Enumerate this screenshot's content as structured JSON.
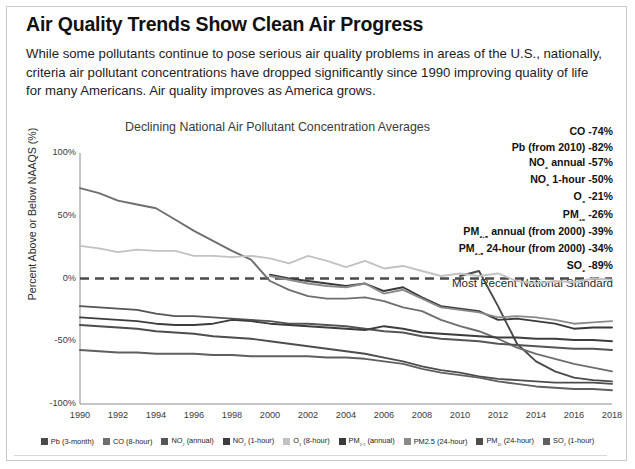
{
  "headline": "Air Quality Trends Show Clean Air Progress",
  "deck": "While some pollutants continue to pose serious air quality problems in areas of the U.S., nationally, criteria air pollutant concentrations have dropped significantly since 1990 improving quality of life for many Americans. Air quality improves as America grows.",
  "standard_note": "Most Recent National Standard",
  "annotations": [
    {
      "label": "CO",
      "value": "-74%"
    },
    {
      "label": "Pb (from 2010)",
      "value": "-82%"
    },
    {
      "label": "NO₂ annual",
      "value": "-57%"
    },
    {
      "label": "NO₂ 1-hour",
      "value": "-50%"
    },
    {
      "label": "O₃",
      "value": "-21%"
    },
    {
      "label": "PM₁₀",
      "value": "-26%"
    },
    {
      "label": "PM₂.₅ annual (from 2000)",
      "value": "-39%"
    },
    {
      "label": "PM₂.₅ 24-hour (from 2000)",
      "value": "-34%"
    },
    {
      "label": "SO₂",
      "value": "-89%"
    }
  ],
  "chart_data": {
    "type": "line",
    "title": "Declining National Air Pollutant Concentration Averages",
    "xlabel": "",
    "ylabel": "Percent Above or Below NAAQS (%)",
    "ylim": [
      -100,
      100
    ],
    "yticks": [
      "100%",
      "50%",
      "0%",
      "-50%",
      "-100%"
    ],
    "ytick_values": [
      100,
      50,
      0,
      -50,
      -100
    ],
    "grid": false,
    "legend_position": "bottom",
    "zero_reference_line": {
      "value": 0,
      "style": "dashed",
      "label": "Most Recent National Standard"
    },
    "x": [
      1990,
      1991,
      1992,
      1993,
      1994,
      1995,
      1996,
      1997,
      1998,
      1999,
      2000,
      2001,
      2002,
      2003,
      2004,
      2005,
      2006,
      2007,
      2008,
      2009,
      2010,
      2011,
      2012,
      2013,
      2014,
      2015,
      2016,
      2017,
      2018
    ],
    "xticks": [
      "1990",
      "1992",
      "1994",
      "1996",
      "1998",
      "2000",
      "2002",
      "2004",
      "2006",
      "2008",
      "2010",
      "2012",
      "2014",
      "2016",
      "2018"
    ],
    "series": [
      {
        "name": "Pb (3-month)",
        "color": "#4a4a4a",
        "values": [
          null,
          null,
          null,
          null,
          null,
          null,
          null,
          null,
          null,
          null,
          null,
          null,
          null,
          null,
          null,
          null,
          null,
          null,
          null,
          null,
          2,
          6,
          -22,
          -52,
          -66,
          -74,
          -79,
          -81,
          -82
        ]
      },
      {
        "name": "CO (8-hour)",
        "color": "#6e6e6e",
        "values": [
          72,
          68,
          62,
          59,
          56,
          47,
          38,
          30,
          22,
          15,
          -2,
          -9,
          -14,
          -16,
          -16,
          -15,
          -18,
          -23,
          -26,
          -33,
          -38,
          -42,
          -48,
          -55,
          -60,
          -64,
          -68,
          -71,
          -74
        ]
      },
      {
        "name": "NO₂ (annual)",
        "color": "#555555",
        "values": [
          -22,
          -23,
          -24,
          -25,
          -28,
          -30,
          -30,
          -31,
          -32,
          -33,
          -34,
          -36,
          -36,
          -37,
          -38,
          -40,
          -42,
          -43,
          -46,
          -48,
          -49,
          -50,
          -52,
          -53,
          -54,
          -55,
          -56,
          -56,
          -57
        ]
      },
      {
        "name": "NO₂ (1-hour)",
        "color": "#3d3d3d",
        "values": [
          -31,
          -32,
          -33,
          -34,
          -36,
          -37,
          -37,
          -36,
          -33,
          -34,
          -36,
          -37,
          -38,
          -39,
          -40,
          -41,
          -38,
          -40,
          -43,
          -44,
          -45,
          -46,
          -47,
          -47,
          -48,
          -48,
          -49,
          -49,
          -50
        ]
      },
      {
        "name": "O₃ (8-hour)",
        "color": "#c2c2c2",
        "values": [
          26,
          24,
          21,
          23,
          22,
          22,
          18,
          18,
          17,
          18,
          16,
          12,
          18,
          14,
          9,
          14,
          8,
          10,
          6,
          2,
          4,
          2,
          4,
          -2,
          -4,
          -2,
          -3,
          0,
          -1
        ]
      },
      {
        "name": "PM₂.₅ (annual)",
        "color": "#3a3a3a",
        "values": [
          null,
          null,
          null,
          null,
          null,
          null,
          null,
          null,
          null,
          null,
          3,
          0,
          -2,
          -4,
          -6,
          -4,
          -10,
          -7,
          -15,
          -22,
          -24,
          -26,
          -33,
          -32,
          -34,
          -36,
          -40,
          -39,
          -39
        ]
      },
      {
        "name": "PM2.5 (24-hour)",
        "color": "#8a8a8a",
        "values": [
          null,
          null,
          null,
          null,
          null,
          null,
          null,
          null,
          null,
          null,
          2,
          -1,
          -4,
          -6,
          -7,
          -4,
          -12,
          -9,
          -16,
          -23,
          -25,
          -27,
          -31,
          -30,
          -31,
          -33,
          -36,
          -35,
          -34
        ]
      },
      {
        "name": "PM₁₀ (24-hour)",
        "color": "#4d4d4d",
        "values": [
          -37,
          -38,
          -39,
          -40,
          -42,
          -43,
          -44,
          -46,
          -47,
          -48,
          -50,
          -52,
          -54,
          -56,
          -58,
          -60,
          -63,
          -66,
          -70,
          -73,
          -75,
          -78,
          -80,
          -81,
          -82,
          -83,
          -83,
          -83,
          -84
        ]
      },
      {
        "name": "SO₂ (1-hour)",
        "color": "#5f5f5f",
        "values": [
          -57,
          -58,
          -59,
          -59,
          -60,
          -60,
          -60,
          -61,
          -61,
          -62,
          -62,
          -62,
          -62,
          -63,
          -63,
          -64,
          -66,
          -68,
          -72,
          -75,
          -77,
          -79,
          -82,
          -84,
          -86,
          -87,
          -88,
          -88,
          -89
        ]
      }
    ]
  }
}
